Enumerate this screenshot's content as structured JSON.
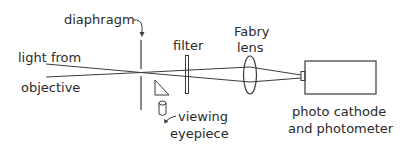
{
  "diagram": {
    "labels": {
      "diaphragm": "diaphragm",
      "filter": "filter",
      "fabry_line1": "Fabry",
      "fabry_line2": "lens",
      "light_line1": "light from",
      "light_line2": "objective",
      "viewing_line1": "viewing",
      "viewing_line2": "eyepiece",
      "photo_line1": "photo cathode",
      "photo_line2": "and photometer"
    },
    "components": [
      "light from objective",
      "diaphragm",
      "filter",
      "Fabry lens",
      "viewing eyepiece",
      "photo cathode and photometer"
    ],
    "colors": {
      "line": "#3a3a3a",
      "text": "#2a2a2a",
      "background": "#ffffff"
    }
  }
}
